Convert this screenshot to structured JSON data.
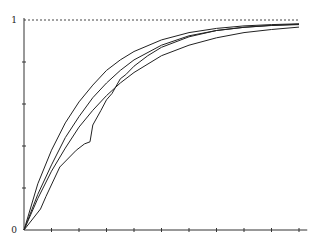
{
  "chart_data": {
    "type": "line",
    "title": "",
    "xlabel": "",
    "ylabel": "",
    "xlim": [
      0,
      10.3
    ],
    "ylim": [
      0,
      1
    ],
    "grid": false,
    "legend": null,
    "y_tick_labels": [
      {
        "value": 0,
        "label": "0"
      },
      {
        "value": 1,
        "label": "1"
      }
    ],
    "y_ticks": [
      0.2,
      0.4,
      0.6,
      0.8
    ],
    "x_ticks": [
      1,
      2,
      3,
      4,
      5,
      6,
      7,
      8,
      9,
      10
    ],
    "reference_line": {
      "y": 1,
      "style": "dashed"
    },
    "series": [
      {
        "name": "smooth-fast",
        "x": [
          0,
          0.5,
          1,
          1.5,
          2,
          2.5,
          3,
          3.5,
          4,
          5,
          6,
          7,
          8,
          9,
          10
        ],
        "y": [
          0,
          0.22,
          0.38,
          0.51,
          0.61,
          0.69,
          0.76,
          0.81,
          0.85,
          0.905,
          0.94,
          0.96,
          0.972,
          0.978,
          0.982
        ]
      },
      {
        "name": "smooth-mid",
        "x": [
          0,
          0.5,
          1,
          1.5,
          2,
          2.5,
          3,
          3.5,
          4,
          5,
          6,
          7,
          8,
          9,
          10
        ],
        "y": [
          0,
          0.17,
          0.31,
          0.44,
          0.54,
          0.63,
          0.7,
          0.76,
          0.81,
          0.88,
          0.925,
          0.95,
          0.965,
          0.974,
          0.978
        ]
      },
      {
        "name": "smooth-slow",
        "x": [
          0,
          0.5,
          1,
          1.5,
          2,
          2.5,
          3,
          3.5,
          4,
          5,
          6,
          7,
          8,
          9,
          10
        ],
        "y": [
          0,
          0.15,
          0.28,
          0.39,
          0.49,
          0.57,
          0.64,
          0.7,
          0.75,
          0.83,
          0.88,
          0.915,
          0.94,
          0.955,
          0.966
        ]
      },
      {
        "name": "piecewise",
        "x": [
          0,
          0.6,
          0.8,
          1.3,
          1.9,
          2.2,
          2.4,
          2.5,
          2.8,
          3.0,
          3.2,
          3.5,
          3.7,
          4.0,
          4.5,
          5.0,
          6.0,
          7.0,
          8.0,
          9.0,
          10.0
        ],
        "y": [
          0,
          0.1,
          0.16,
          0.3,
          0.38,
          0.41,
          0.42,
          0.5,
          0.57,
          0.62,
          0.65,
          0.72,
          0.74,
          0.78,
          0.83,
          0.87,
          0.92,
          0.95,
          0.965,
          0.975,
          0.98
        ]
      }
    ]
  }
}
